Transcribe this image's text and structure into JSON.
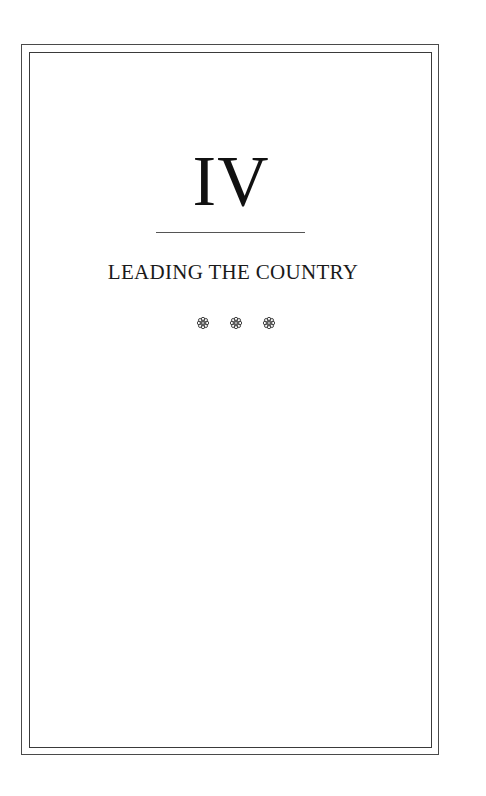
{
  "page": {
    "part_numeral": "IV",
    "part_title": "LEADING THE COUNTRY",
    "ornaments": [
      "flower-ornament",
      "flower-ornament",
      "flower-ornament"
    ],
    "colors": {
      "border": "#4a4a4a",
      "text": "#111111",
      "background": "#ffffff"
    }
  }
}
